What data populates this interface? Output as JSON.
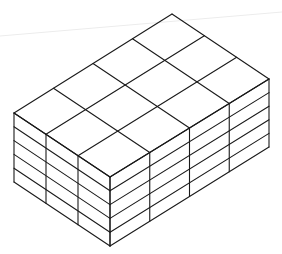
{
  "figure": {
    "grid": {
      "depth_cells": 3,
      "width_cells": 4,
      "layers": 5
    },
    "colors": {
      "line": "#1a1a1a",
      "background": "#ffffff"
    },
    "vertices": {
      "back": [
        172,
        14
      ],
      "left_top": [
        14,
        113
      ],
      "front_top": [
        110,
        177
      ],
      "right_top": [
        269,
        79
      ],
      "left_bottom": [
        14,
        182
      ],
      "front_bottom": [
        110,
        246
      ],
      "right_bottom": [
        269,
        147
      ]
    }
  }
}
